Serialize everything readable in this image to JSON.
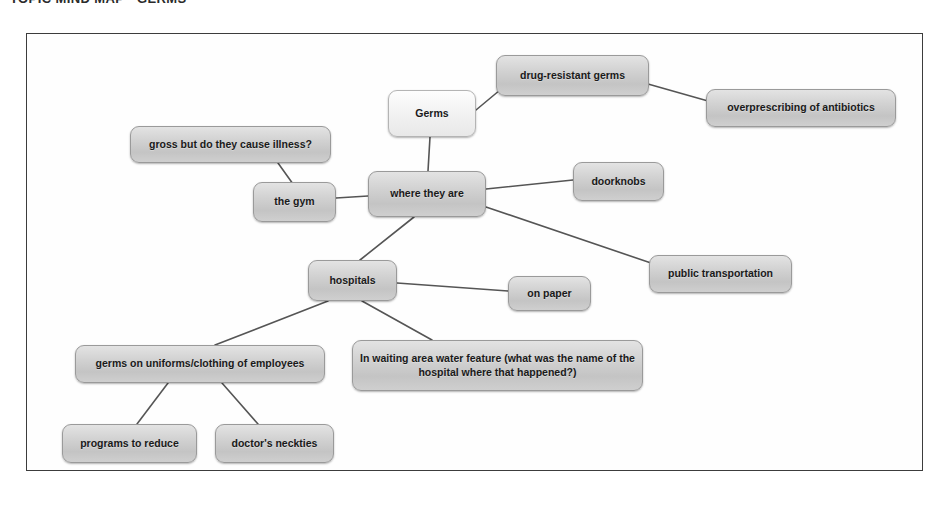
{
  "page": {
    "heading": "TOPIC MIND MAP - GERMS",
    "background_color": "#ffffff",
    "frame_border_color": "#3c3c3c"
  },
  "diagram": {
    "type": "mind-map",
    "title": "Germs",
    "node_fill_color": "#d2d2d2",
    "node_border_color": "#9a9a9a",
    "connector_color": "#555555",
    "nodes": [
      {
        "id": "germs",
        "label": "Germs",
        "x": 388,
        "y": 90,
        "w": 88,
        "h": 47,
        "style": "light"
      },
      {
        "id": "drug-resistant",
        "label": "drug-resistant germs",
        "x": 496,
        "y": 55,
        "w": 153,
        "h": 41,
        "style": "dark"
      },
      {
        "id": "overprescribing",
        "label": "overprescribing of antibiotics",
        "x": 706,
        "y": 89,
        "w": 190,
        "h": 38,
        "style": "dark"
      },
      {
        "id": "where-they-are",
        "label": "where they are",
        "x": 368,
        "y": 171,
        "w": 118,
        "h": 46,
        "style": "dark"
      },
      {
        "id": "gross-illness",
        "label": "gross but do they cause illness?",
        "x": 130,
        "y": 126,
        "w": 201,
        "h": 37,
        "style": "dark"
      },
      {
        "id": "the-gym",
        "label": "the gym",
        "x": 253,
        "y": 182,
        "w": 83,
        "h": 40,
        "style": "dark"
      },
      {
        "id": "doorknobs",
        "label": "doorknobs",
        "x": 573,
        "y": 162,
        "w": 91,
        "h": 39,
        "style": "dark"
      },
      {
        "id": "public-transport",
        "label": "public transportation",
        "x": 649,
        "y": 255,
        "w": 143,
        "h": 38,
        "style": "dark"
      },
      {
        "id": "hospitals",
        "label": "hospitals",
        "x": 308,
        "y": 260,
        "w": 89,
        "h": 41,
        "style": "dark"
      },
      {
        "id": "on-paper",
        "label": "on paper",
        "x": 508,
        "y": 276,
        "w": 83,
        "h": 35,
        "style": "dark"
      },
      {
        "id": "uniforms",
        "label": "germs on uniforms/clothing of employees",
        "x": 75,
        "y": 345,
        "w": 250,
        "h": 38,
        "style": "dark"
      },
      {
        "id": "water-feature",
        "label": "In waiting area water feature (what was the name of the hospital where that happened?)",
        "x": 352,
        "y": 340,
        "w": 291,
        "h": 51,
        "style": "dark"
      },
      {
        "id": "programs",
        "label": "programs to reduce",
        "x": 62,
        "y": 424,
        "w": 135,
        "h": 39,
        "style": "dark"
      },
      {
        "id": "neckties",
        "label": "doctor's neckties",
        "x": 215,
        "y": 424,
        "w": 119,
        "h": 39,
        "style": "dark"
      }
    ],
    "edges": [
      {
        "from": "germs",
        "to": "drug-resistant",
        "x1": 476,
        "y1": 110,
        "x2": 500,
        "y2": 90
      },
      {
        "from": "drug-resistant",
        "to": "overprescribing",
        "x1": 648,
        "y1": 84,
        "x2": 708,
        "y2": 101
      },
      {
        "from": "germs",
        "to": "where-they-are",
        "x1": 430,
        "y1": 137,
        "x2": 428,
        "y2": 171
      },
      {
        "from": "gross-illness",
        "to": "the-gym",
        "x1": 278,
        "y1": 163,
        "x2": 293,
        "y2": 184
      },
      {
        "from": "the-gym",
        "to": "where-they-are",
        "x1": 336,
        "y1": 198,
        "x2": 368,
        "y2": 196
      },
      {
        "from": "where-they-are",
        "to": "doorknobs",
        "x1": 486,
        "y1": 189,
        "x2": 573,
        "y2": 180
      },
      {
        "from": "where-they-are",
        "to": "public-transport",
        "x1": 486,
        "y1": 207,
        "x2": 651,
        "y2": 263
      },
      {
        "from": "where-they-are",
        "to": "hospitals",
        "x1": 414,
        "y1": 217,
        "x2": 360,
        "y2": 260
      },
      {
        "from": "hospitals",
        "to": "on-paper",
        "x1": 397,
        "y1": 283,
        "x2": 508,
        "y2": 291
      },
      {
        "from": "hospitals",
        "to": "uniforms",
        "x1": 328,
        "y1": 301,
        "x2": 215,
        "y2": 345
      },
      {
        "from": "hospitals",
        "to": "water-feature",
        "x1": 362,
        "y1": 301,
        "x2": 432,
        "y2": 340
      },
      {
        "from": "uniforms",
        "to": "programs",
        "x1": 168,
        "y1": 383,
        "x2": 137,
        "y2": 424
      },
      {
        "from": "uniforms",
        "to": "neckties",
        "x1": 222,
        "y1": 383,
        "x2": 258,
        "y2": 424
      }
    ]
  }
}
